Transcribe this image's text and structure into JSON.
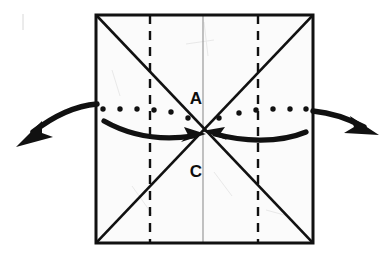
{
  "figure": {
    "kind": "origami-fold-diagram",
    "background_color": "#ffffff",
    "ink_color": "#111111",
    "paper_fill": "#fbfbfb",
    "crease_faint_color": "#9a9a9a",
    "labels": [
      {
        "name": "point-a",
        "text": "A",
        "x": 196,
        "y": 100
      },
      {
        "name": "point-c",
        "text": "C",
        "x": 196,
        "y": 173
      }
    ],
    "square": {
      "name": "paper-square",
      "top_left_x": 96,
      "top_left_y": 15,
      "top_right_x": 313,
      "top_right_y": 15,
      "bottom_right_x": 313,
      "bottom_right_y": 243,
      "bottom_left_x": 96,
      "bottom_left_y": 243,
      "stroke_width": 3
    },
    "diagonals": [
      {
        "name": "diagonal-crease-tl-br",
        "x1": 97,
        "y1": 16,
        "x2": 312,
        "y2": 242
      },
      {
        "name": "diagonal-crease-tr-bl",
        "x1": 312,
        "y1": 16,
        "x2": 97,
        "y2": 242
      }
    ],
    "dashed_fold_lines": [
      {
        "name": "dashed-fold-line-left",
        "x": 150,
        "y1": 15,
        "y2": 243,
        "dash": "9 7"
      },
      {
        "name": "dashed-fold-line-right",
        "x": 258,
        "y1": 15,
        "y2": 243,
        "dash": "9 7"
      }
    ],
    "center_crease": {
      "name": "center-vertical-crease",
      "x": 203,
      "y1": 16,
      "y2": 242
    },
    "dotted_horizontal": {
      "name": "dotted-horizontal-fold-line",
      "y": 109,
      "x_start": 101,
      "x_end": 310,
      "dot_radius": 2.6,
      "spacing": 17
    },
    "arrows": {
      "inner_left": {
        "name": "inward-arrow-left",
        "path": "M 104 121 C 132 137, 166 139, 196 136",
        "tip_x": 203,
        "tip_y": 134
      },
      "inner_right": {
        "name": "inward-arrow-right",
        "path": "M 305 131 C 276 143, 240 140, 212 134",
        "tip_x": 204,
        "tip_y": 132
      },
      "outer_left": {
        "name": "outward-arrow-left",
        "path": "M 96 104 C 72 107, 48 120, 31 134",
        "tip_x": 17,
        "tip_y": 146
      },
      "outer_right": {
        "name": "outward-arrow-right",
        "path": "M 314 111 C 334 113, 352 120, 366 128",
        "tip_x": 377,
        "tip_y": 134
      }
    },
    "frame": {
      "name": "scan-edge-line",
      "x": 23,
      "y1": 14,
      "y2": 30
    }
  }
}
